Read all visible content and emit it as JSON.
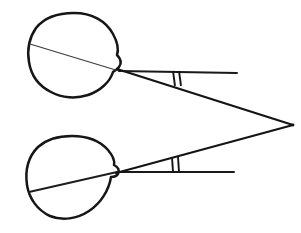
{
  "figure": {
    "background_color": "#ffffff",
    "ink_color": "#161616",
    "canvas": {
      "width": 301,
      "height": 233
    }
  },
  "eyes": [
    {
      "id": "upper-eye",
      "label": "Upper eye globe",
      "center": {
        "x": 72,
        "y": 55
      },
      "radius": 43,
      "cornea_apex": {
        "x": 119,
        "y": 71
      },
      "globe_path": "M 74,13 C 92,13 106,21 113,34 C 118,43 119,49 117,55 C 121,59 122,63 119,67 C 117,70 114,71 113,72 C 110,82 100,91 88,95 C 76,99 62,98 51,92 C 39,86 31,75 29,62 C 27,50 29,38 36,28 C 44,18 58,13 74,13 Z",
      "internal_axis": {
        "x1": 30,
        "y1": 44,
        "x2": 119,
        "y2": 71
      }
    },
    {
      "id": "lower-eye",
      "label": "Lower eye globe",
      "center": {
        "x": 73,
        "y": 180
      },
      "radius": 44,
      "cornea_apex": {
        "x": 117,
        "y": 172
      },
      "globe_path": "M 72,136 C 88,136 100,141 108,150 C 113,156 115,161 114,165 C 118,167 120,170 118,174 C 116,177 113,177 111,177 C 109,190 101,203 89,211 C 77,219 62,221 50,216 C 37,210 29,198 27,185 C 25,171 28,157 38,147 C 47,139 59,136 72,136 Z",
      "internal_axis": {
        "x1": 29,
        "y1": 192,
        "x2": 117,
        "y2": 172
      }
    }
  ],
  "rays": [
    {
      "id": "upper-optical-axis",
      "label": "Upper eye optical axis",
      "from": {
        "x": 119,
        "y": 71
      },
      "to": {
        "x": 237,
        "y": 73
      }
    },
    {
      "id": "upper-visual-axis",
      "label": "Upper eye visual axis to fixation point",
      "from": {
        "x": 117,
        "y": 69
      },
      "to": {
        "x": 293,
        "y": 125
      }
    },
    {
      "id": "lower-optical-axis",
      "label": "Lower eye optical axis",
      "from": {
        "x": 117,
        "y": 172
      },
      "to": {
        "x": 234,
        "y": 172
      }
    },
    {
      "id": "lower-visual-axis",
      "label": "Lower eye visual axis to fixation point",
      "from": {
        "x": 116,
        "y": 173
      },
      "to": {
        "x": 293,
        "y": 125
      }
    }
  ],
  "fixation_point": {
    "label": "Fixation point",
    "x": 293,
    "y": 125
  },
  "angle_markers": [
    {
      "id": "upper-angle-marker",
      "label": "Upper angle marker (double tick)",
      "ticks": [
        {
          "x1": 173,
          "y1": 71,
          "x2": 175,
          "y2": 86
        },
        {
          "x1": 179,
          "y1": 71,
          "x2": 181,
          "y2": 86
        }
      ]
    },
    {
      "id": "lower-angle-marker",
      "label": "Lower angle marker (double tick)",
      "ticks": [
        {
          "x1": 172,
          "y1": 157,
          "x2": 173,
          "y2": 172
        },
        {
          "x1": 178,
          "y1": 157,
          "x2": 179,
          "y2": 172
        }
      ]
    }
  ]
}
